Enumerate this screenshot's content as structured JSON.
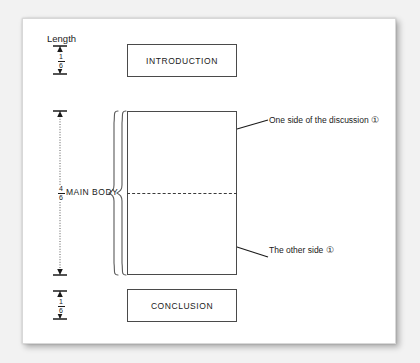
{
  "document": {
    "type": "essay-structure-diagram",
    "background_color": "#f2f2f2",
    "page_color": "#ffffff",
    "ink_color": "#1a1a1a"
  },
  "measurement_column": {
    "axis_label": "Length",
    "segments": [
      {
        "id": "introduction",
        "numerator": "1",
        "denominator": "6",
        "fraction_text": "1/6"
      },
      {
        "id": "main_body",
        "numerator": "4",
        "denominator": "6",
        "fraction_text": "4/6"
      },
      {
        "id": "conclusion",
        "numerator": "1",
        "denominator": "6",
        "fraction_text": "1/6"
      }
    ]
  },
  "blocks": {
    "introduction": {
      "label": "INTRODUCTION"
    },
    "main_body": {
      "label": "MAIN BODY"
    },
    "conclusion": {
      "label": "CONCLUSION"
    }
  },
  "annotations": [
    {
      "id": "upper-half",
      "text": "One side of the discussion ①"
    },
    {
      "id": "lower-half",
      "text": "The other side ①"
    }
  ]
}
